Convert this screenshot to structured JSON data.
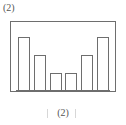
{
  "top_label": "(2)",
  "bottom_label": "(2)",
  "marks": {
    "left_mark": "|",
    "right_mark": "|"
  },
  "colors": {
    "frame_stroke": "#6e6e6e",
    "bar_stroke": "#6e6e6e",
    "bar_fill": "#ffffff",
    "background": "#ffffff",
    "text": "#555555",
    "faint_mark": "#c9c9c9"
  },
  "chart_data": {
    "type": "bar",
    "title": "(2)",
    "subtitle": "",
    "xlabel": "",
    "ylabel": "",
    "categories": [
      "1",
      "2",
      "3",
      "4",
      "5",
      "6"
    ],
    "values": [
      6,
      4,
      2,
      2,
      4,
      6
    ],
    "ylim": [
      0,
      7
    ],
    "xlim": [
      0,
      6
    ],
    "grid": false,
    "legend": false,
    "legend_position": "none",
    "bar_outline_only": true,
    "symmetric": true,
    "annotations": [
      "(2)"
    ]
  }
}
